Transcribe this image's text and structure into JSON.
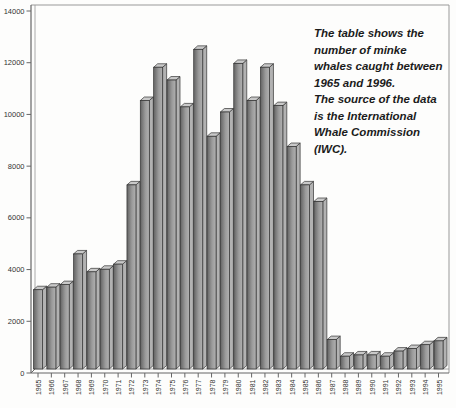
{
  "figure": {
    "caption": "The table shows the\nnumber of minke\nwhales caught between\n1965 and 1996.\nThe source of the data\nis the International\nWhale Commission\n(IWC)."
  },
  "chart_data": {
    "type": "bar",
    "style": "3d-column",
    "title": "",
    "xlabel": "",
    "ylabel": "",
    "categories": [
      "1965",
      "1966",
      "1967",
      "1968",
      "1969",
      "1970",
      "1971",
      "1972",
      "1973",
      "1974",
      "1975",
      "1976",
      "1977",
      "1978",
      "1979",
      "1980",
      "1981",
      "1982",
      "1983",
      "1984",
      "1985",
      "1986",
      "1987",
      "1988",
      "1989",
      "1990",
      "1991",
      "1992",
      "1993",
      "1994",
      "1995"
    ],
    "values": [
      3100,
      3200,
      3300,
      4500,
      3800,
      3900,
      4100,
      7200,
      10500,
      11800,
      11300,
      10250,
      12500,
      9100,
      10050,
      11950,
      10500,
      11800,
      10300,
      8700,
      7200,
      6550,
      1150,
      500,
      550,
      550,
      500,
      700,
      800,
      950,
      1100
    ],
    "ylim": [
      0,
      14000
    ],
    "yticks": [
      0,
      2000,
      4000,
      6000,
      8000,
      10000,
      12000,
      14000
    ],
    "grid": false,
    "legend": "none",
    "colors": {
      "bar_front_dark": "#636363",
      "bar_front_mid": "#9a9a9a",
      "bar_front_light": "#b2b2b2",
      "bar_top": "#c9c9c9",
      "bar_side": "#b2b2b2",
      "bar_outline": "#333333",
      "axis": "#666666",
      "frame": "#999999",
      "wall": "#aaaaaa",
      "tick_label": "#333333",
      "background": "#fdfdfc"
    }
  }
}
